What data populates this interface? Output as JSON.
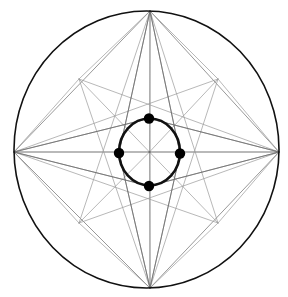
{
  "figure": {
    "background_color": "#ffffff",
    "width": 288,
    "height": 297
  },
  "chart_data": {
    "type": "diagram",
    "xlabel": "",
    "ylabel": "",
    "grid": false,
    "legend": false,
    "coordinate_space": {
      "width": 288,
      "height": 297,
      "origin": "top-left",
      "units": "pixels"
    },
    "outer_circle": {
      "name": "outer-circle",
      "center_x": 146.5,
      "center_y": 149.5,
      "radius_x": 132.5,
      "radius_y": 138.5,
      "stroke": "#111111",
      "stroke_width": 1.6,
      "fill": "none"
    },
    "inner_circle": {
      "name": "inner-circle",
      "center_x": 149.5,
      "center_y": 152.0,
      "radius_x": 30.5,
      "radius_y": 33.5,
      "stroke": "#111111",
      "stroke_width": 2.6,
      "fill": "none"
    },
    "center_point": {
      "name": "center",
      "x": 149.5,
      "y": 152.0
    },
    "outer_vertices": [
      {
        "label": "N",
        "name": "outer-vertex-top",
        "x": 150.0,
        "y": 11.0
      },
      {
        "label": "E",
        "name": "outer-vertex-right",
        "x": 279.0,
        "y": 152.0
      },
      {
        "label": "S",
        "name": "outer-vertex-bottom",
        "x": 150.0,
        "y": 288.0
      },
      {
        "label": "W",
        "name": "outer-vertex-left",
        "x": 14.0,
        "y": 152.0
      }
    ],
    "inner_marked_points": [
      {
        "label": "n",
        "name": "inner-point-top",
        "x": 149.0,
        "y": 118.5,
        "radius": 5.2,
        "fill": "#000000"
      },
      {
        "label": "e",
        "name": "inner-point-right",
        "x": 180.0,
        "y": 153.5,
        "radius": 5.2,
        "fill": "#000000"
      },
      {
        "label": "s",
        "name": "inner-point-bottom",
        "x": 149.0,
        "y": 186.0,
        "radius": 5.2,
        "fill": "#000000"
      },
      {
        "label": "w",
        "name": "inner-point-left",
        "x": 119.0,
        "y": 153.0,
        "radius": 5.2,
        "fill": "#000000"
      }
    ],
    "intersection_nodes": [
      {
        "name": "node-upper-left",
        "x": 79.0,
        "y": 79.0
      },
      {
        "name": "node-upper-right",
        "x": 218.0,
        "y": 79.0
      },
      {
        "name": "node-lower-left",
        "x": 79.0,
        "y": 223.0
      },
      {
        "name": "node-lower-right",
        "x": 218.0,
        "y": 223.0
      }
    ],
    "chords": [
      {
        "name": "chord-top-left",
        "from": "N",
        "to": "W",
        "x1": 150.0,
        "y1": 11.0,
        "x2": 14.0,
        "y2": 152.0
      },
      {
        "name": "chord-top-right",
        "from": "N",
        "to": "E",
        "x1": 150.0,
        "y1": 11.0,
        "x2": 279.0,
        "y2": 152.0
      },
      {
        "name": "chord-bottom-left",
        "from": "S",
        "to": "W",
        "x1": 150.0,
        "y1": 288.0,
        "x2": 14.0,
        "y2": 152.0
      },
      {
        "name": "chord-bottom-right",
        "from": "S",
        "to": "E",
        "x1": 150.0,
        "y1": 288.0,
        "x2": 279.0,
        "y2": 152.0
      }
    ],
    "diameters": [
      {
        "name": "diameter-vertical",
        "x1": 150.0,
        "y1": 11.0,
        "x2": 150.0,
        "y2": 288.0
      },
      {
        "name": "diameter-horizontal",
        "x1": 14.0,
        "y1": 152.0,
        "x2": 279.0,
        "y2": 152.0
      }
    ],
    "radial_lines_from_outer_vertices": [
      {
        "name": "ray-N-to-w",
        "from": "N",
        "to": "w",
        "x1": 150.0,
        "y1": 11.0,
        "x2": 119.0,
        "y2": 153.0
      },
      {
        "name": "ray-N-to-e",
        "from": "N",
        "to": "e",
        "x1": 150.0,
        "y1": 11.0,
        "x2": 180.0,
        "y2": 153.5
      },
      {
        "name": "ray-S-to-w",
        "from": "S",
        "to": "w",
        "x1": 150.0,
        "y1": 288.0,
        "x2": 119.0,
        "y2": 153.0
      },
      {
        "name": "ray-S-to-e",
        "from": "S",
        "to": "e",
        "x1": 150.0,
        "y1": 288.0,
        "x2": 180.0,
        "y2": 153.5
      },
      {
        "name": "ray-W-to-n",
        "from": "W",
        "to": "n",
        "x1": 14.0,
        "y1": 152.0,
        "x2": 149.0,
        "y2": 118.5
      },
      {
        "name": "ray-W-to-s",
        "from": "W",
        "to": "s",
        "x1": 14.0,
        "y1": 152.0,
        "x2": 149.0,
        "y2": 186.0
      },
      {
        "name": "ray-E-to-n",
        "from": "E",
        "to": "n",
        "x1": 279.0,
        "y1": 152.0,
        "x2": 149.0,
        "y2": 118.5
      },
      {
        "name": "ray-E-to-s",
        "from": "E",
        "to": "s",
        "x1": 279.0,
        "y1": 152.0,
        "x2": 149.0,
        "y2": 186.0
      }
    ],
    "extended_rays_through_center": [
      {
        "name": "ray-N-through-center-to-sw",
        "x1": 150.0,
        "y1": 11.0,
        "x2": 119.0,
        "y2": 153.0
      },
      {
        "name": "ray-N-through-center-to-se",
        "x1": 150.0,
        "y1": 11.0,
        "x2": 180.0,
        "y2": 153.5
      },
      {
        "name": "ray-ul-diagonal",
        "x1": 14.0,
        "y1": 152.0,
        "x2": 150.0,
        "y2": 11.0
      },
      {
        "name": "ray-ur-diagonal",
        "x1": 279.0,
        "y1": 152.0,
        "x2": 150.0,
        "y2": 11.0
      },
      {
        "name": "ray-ll-diagonal",
        "x1": 14.0,
        "y1": 152.0,
        "x2": 150.0,
        "y2": 288.0
      },
      {
        "name": "ray-lr-diagonal",
        "x1": 279.0,
        "y1": 152.0,
        "x2": 150.0,
        "y2": 288.0
      }
    ],
    "center_spokes": [
      {
        "name": "spoke-n",
        "angle_deg": 90,
        "x2": 150.0,
        "y2": 11.0
      },
      {
        "name": "spoke-ne",
        "angle_deg": 45,
        "x2": 218.0,
        "y2": 79.0
      },
      {
        "name": "spoke-e",
        "angle_deg": 0,
        "x2": 279.0,
        "y2": 152.0
      },
      {
        "name": "spoke-se",
        "angle_deg": 315,
        "x2": 218.0,
        "y2": 223.0
      },
      {
        "name": "spoke-s",
        "angle_deg": 270,
        "x2": 150.0,
        "y2": 288.0
      },
      {
        "name": "spoke-sw",
        "angle_deg": 225,
        "x2": 79.0,
        "y2": 223.0
      },
      {
        "name": "spoke-w",
        "angle_deg": 180,
        "x2": 14.0,
        "y2": 152.0
      },
      {
        "name": "spoke-nw",
        "angle_deg": 135,
        "x2": 79.0,
        "y2": 79.0
      }
    ],
    "colors": {
      "heavy_stroke": "#111111",
      "light_stroke": "#6b6b6b",
      "faint_stroke": "#9a9a9a",
      "dot_fill": "#000000",
      "background": "#ffffff"
    },
    "stroke_widths": {
      "outer_circle": 1.6,
      "inner_circle": 2.6,
      "construction_line": 0.7
    }
  }
}
